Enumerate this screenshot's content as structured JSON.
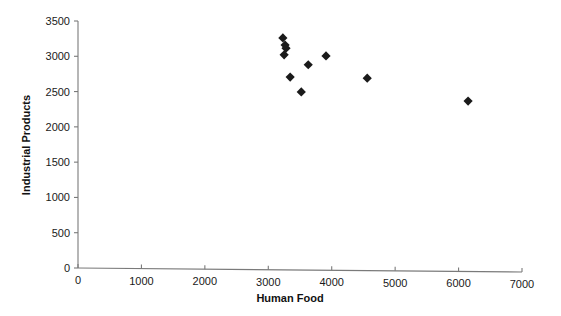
{
  "chart_data": {
    "type": "scatter",
    "title": "",
    "xlabel": "Human Food",
    "ylabel": "Industrial Products",
    "xlim": [
      0,
      7000
    ],
    "ylim": [
      0,
      3500
    ],
    "xticks": [
      0,
      1000,
      2000,
      3000,
      4000,
      5000,
      6000,
      7000
    ],
    "yticks": [
      0,
      500,
      1000,
      1500,
      2000,
      2500,
      3000,
      3500
    ],
    "xtick_labels": [
      "0",
      "1000",
      "2000",
      "3000",
      "4000",
      "5000",
      "6000",
      "7000"
    ],
    "ytick_labels": [
      "0",
      "500",
      "1000",
      "1500",
      "2000",
      "2500",
      "3000",
      "3500"
    ],
    "grid": false,
    "legend": false,
    "marker_shape": "diamond",
    "marker_color": "#1a1a1a",
    "points": [
      {
        "x": 3230,
        "y": 3260
      },
      {
        "x": 3265,
        "y": 3160
      },
      {
        "x": 3280,
        "y": 3115
      },
      {
        "x": 3250,
        "y": 3020
      },
      {
        "x": 3345,
        "y": 2705
      },
      {
        "x": 3520,
        "y": 2495
      },
      {
        "x": 3630,
        "y": 2880
      },
      {
        "x": 3910,
        "y": 3005
      },
      {
        "x": 4560,
        "y": 2690
      },
      {
        "x": 6150,
        "y": 2365
      }
    ]
  },
  "colors": {
    "marker": "#1a1a1a",
    "axis": "#7a7a7a",
    "text": "#111111",
    "background": "#ffffff"
  }
}
